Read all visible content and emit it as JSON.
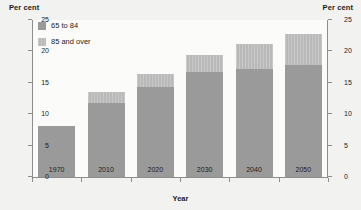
{
  "chart_data": {
    "type": "bar",
    "title": "",
    "subtitle": "",
    "stacked": true,
    "xlabel": "Year",
    "ylabel": "Per cent",
    "ylabel_right": "Per cent",
    "categories": [
      "1970",
      "2010",
      "2020",
      "2030",
      "2040",
      "2050"
    ],
    "series": [
      {
        "name": "65 to 84",
        "values": [
          8.2,
          11.8,
          14.3,
          16.7,
          17.2,
          17.8
        ],
        "color": "#9a9a9a"
      },
      {
        "name": "85 and over",
        "values": [
          0.0,
          1.7,
          2.1,
          2.8,
          4.0,
          4.9
        ],
        "color": "#b9b9b9"
      }
    ],
    "totals": [
      8.2,
      13.5,
      16.4,
      19.5,
      21.2,
      22.7
    ],
    "ylim": [
      0,
      25
    ],
    "yticks": [
      0,
      5,
      10,
      15,
      20,
      25
    ],
    "ytick_labels": [
      "0",
      "5",
      "10",
      "15",
      "20",
      "25"
    ],
    "ytick_labels_right": [
      "0",
      "5",
      "10",
      "15",
      "20",
      "25"
    ],
    "grid": false,
    "legend_position": "top-left",
    "legend": [
      "65 to 84",
      "85 and over"
    ]
  },
  "colors": {
    "page_background": "#f2f2f0",
    "plot_background": "#fbfbfa",
    "axis": "#8d8d8d",
    "text": "#1b1b1b",
    "series_lower": "#9a9a9a",
    "series_upper": "#b9b9b9"
  }
}
